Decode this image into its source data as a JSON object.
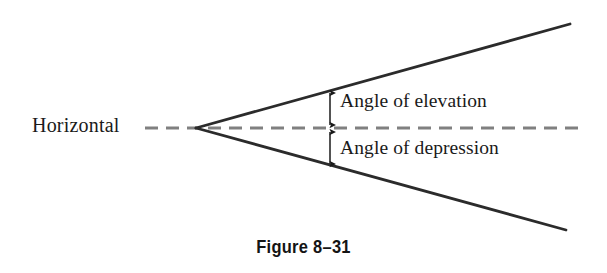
{
  "figure": {
    "caption": "Figure 8–31",
    "background_color": "#ffffff",
    "ray_color": "#2b2b2b",
    "dashed_line_color": "#808080",
    "arrow_color": "#1a1a1a",
    "text_color": "#1a1a1a"
  },
  "labels": {
    "horizontal": "Horizontal",
    "angle_of_elevation": "Angle of elevation",
    "angle_of_depression": "Angle of depression"
  },
  "diagram_data": {
    "type": "geometric-diagram",
    "description": "Angle of elevation and angle of depression measured from a horizontal reference line at an observer vertex",
    "vertex": {
      "x": 196,
      "y": 128
    },
    "rays": [
      {
        "name": "line-of-sight-upward",
        "from": {
          "x": 196,
          "y": 128
        },
        "to": {
          "x": 570,
          "y": 24
        },
        "style": "solid"
      },
      {
        "name": "line-of-sight-downward",
        "from": {
          "x": 196,
          "y": 128
        },
        "to": {
          "x": 566,
          "y": 230
        },
        "style": "solid"
      }
    ],
    "reference_line": {
      "name": "horizontal-dashed-line",
      "from": {
        "x": 145,
        "y": 128
      },
      "to": {
        "x": 582,
        "y": 128
      },
      "style": "dashed",
      "dash_length": 13,
      "gap_length": 8
    },
    "angle_markers": [
      {
        "name": "elevation-arrow",
        "x": 330,
        "y_top": 91,
        "y_bottom": 126,
        "heads": "both"
      },
      {
        "name": "depression-arrow",
        "x": 330,
        "y_top": 130,
        "y_bottom": 166,
        "heads": "both"
      }
    ]
  }
}
